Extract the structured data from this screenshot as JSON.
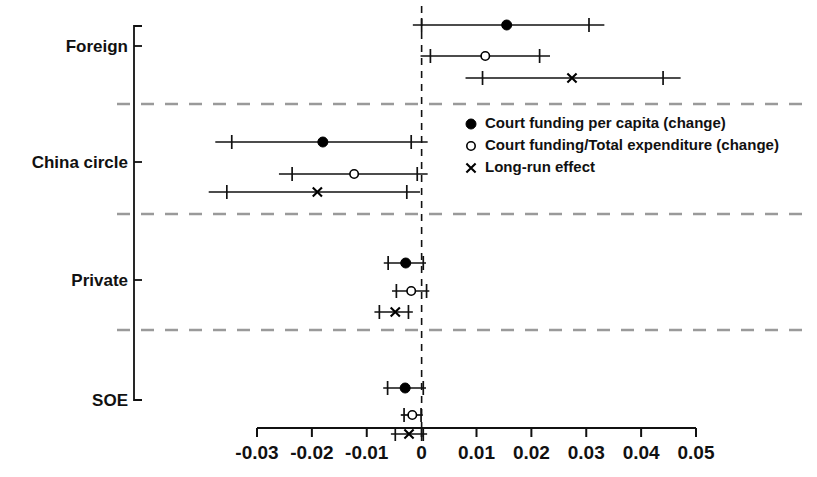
{
  "chart_data": {
    "type": "scatter",
    "title": "",
    "subtitle": "",
    "xlabel": "",
    "ylabel": "",
    "xlim": [
      -0.035,
      0.053
    ],
    "grid": false,
    "zero_reference_line": 0,
    "axis": {
      "tick_values": [
        -0.03,
        -0.02,
        -0.01,
        0,
        0.01,
        0.02,
        0.03,
        0.04,
        0.05
      ],
      "tick_labels": [
        "-0.03",
        "-0.02",
        "-0.01",
        "0",
        "0.01",
        "0.02",
        "0.03",
        "0.04",
        "0.05"
      ]
    },
    "legend": {
      "position": "middle-right",
      "entries": [
        {
          "marker": "filled-circle",
          "label": "Court funding per capita (change)"
        },
        {
          "marker": "open-circle",
          "label": "Court funding/Total expenditure (change)"
        },
        {
          "marker": "cross",
          "label": "Long-run effect"
        }
      ]
    },
    "groups": [
      {
        "name": "Foreign",
        "label": "Foreign",
        "estimates": [
          {
            "series": "Court funding per capita (change)",
            "marker": "filled-circle",
            "estimate": 0.0155,
            "ci_low": -0.0016,
            "ci_high": 0.0333,
            "inner_low": -0.0,
            "inner_high": 0.0305
          },
          {
            "series": "Court funding/Total expenditure (change)",
            "marker": "open-circle",
            "estimate": 0.0116,
            "ci_low": -0.0002,
            "ci_high": 0.0234,
            "inner_low": 0.0016,
            "inner_high": 0.0215
          },
          {
            "series": "Long-run effect",
            "marker": "cross",
            "estimate": 0.0274,
            "ci_low": 0.008,
            "ci_high": 0.0472,
            "inner_low": 0.0111,
            "inner_high": 0.044
          }
        ]
      },
      {
        "name": "China circle",
        "label": "China circle",
        "estimates": [
          {
            "series": "Court funding per capita (change)",
            "marker": "filled-circle",
            "estimate": -0.018,
            "ci_low": -0.0376,
            "ci_high": 0.0011,
            "inner_low": -0.0346,
            "inner_high": -0.0019
          },
          {
            "series": "Court funding/Total expenditure (change)",
            "marker": "open-circle",
            "estimate": -0.0123,
            "ci_low": -0.026,
            "ci_high": 0.0011,
            "inner_low": -0.0236,
            "inner_high": -0.0008
          },
          {
            "series": "Long-run effect",
            "marker": "cross",
            "estimate": -0.019,
            "ci_low": -0.0388,
            "ci_high": -0.0003,
            "inner_low": -0.0355,
            "inner_high": -0.0027
          }
        ]
      },
      {
        "name": "Private",
        "label": "Private",
        "estimates": [
          {
            "series": "Court funding per capita (change)",
            "marker": "filled-circle",
            "estimate": -0.0029,
            "ci_low": -0.0069,
            "ci_high": 0.0008,
            "inner_low": -0.0061,
            "inner_high": 0.0003
          },
          {
            "series": "Court funding/Total expenditure (change)",
            "marker": "open-circle",
            "estimate": -0.0019,
            "ci_low": -0.0054,
            "ci_high": 0.0014,
            "inner_low": -0.0046,
            "inner_high": 0.0009
          },
          {
            "series": "Long-run effect",
            "marker": "cross",
            "estimate": -0.0048,
            "ci_low": -0.0086,
            "ci_high": -0.0016,
            "inner_low": -0.0077,
            "inner_high": -0.0024
          }
        ]
      },
      {
        "name": "SOE",
        "label": "SOE",
        "estimates": [
          {
            "series": "Court funding per capita (change)",
            "marker": "filled-circle",
            "estimate": -0.003,
            "ci_low": -0.007,
            "ci_high": 0.0008,
            "inner_low": -0.0062,
            "inner_high": 0.0003
          },
          {
            "series": "Court funding/Total expenditure (change)",
            "marker": "open-circle",
            "estimate": -0.0017,
            "ci_low": -0.0038,
            "ci_high": 0.0002,
            "inner_low": -0.0032,
            "inner_high": -0.0001
          },
          {
            "series": "Long-run effect",
            "marker": "cross",
            "estimate": -0.0023,
            "ci_low": -0.0056,
            "ci_high": 0.001,
            "inner_low": -0.0048,
            "inner_high": 0.0003
          }
        ]
      }
    ],
    "colors": {
      "marker": "#000000",
      "line": "#111111",
      "separator": "#9a9a9a",
      "zero_line": "#111111",
      "background": "#ffffff"
    }
  }
}
